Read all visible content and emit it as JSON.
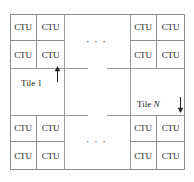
{
  "figure": {
    "name": "picture-partitioned-into-tiles-of-ctus",
    "frame_color": "#8d8d90",
    "rule_color": "#9a9a9d",
    "background": "#ffffff",
    "ctu_label": "CTU",
    "ellipsis": "· · ·",
    "ctu_groups": [
      {
        "id": "top-left",
        "cells": [
          "CTU",
          "CTU",
          "CTU",
          "CTU"
        ]
      },
      {
        "id": "top-right",
        "cells": [
          "CTU",
          "CTU",
          "CTU",
          "CTU"
        ]
      },
      {
        "id": "bottom-left",
        "cells": [
          "CTU",
          "CTU",
          "CTU",
          "CTU"
        ]
      },
      {
        "id": "bottom-right",
        "cells": [
          "CTU",
          "CTU",
          "CTU",
          "CTU"
        ]
      }
    ],
    "labels": {
      "tile_first_prefix": "Tile",
      "tile_first_index": "1",
      "tile_last_prefix": "Tile",
      "tile_last_index": "N"
    },
    "ellipsis_top": "· · ·",
    "ellipsis_bottom": "· · ·"
  }
}
